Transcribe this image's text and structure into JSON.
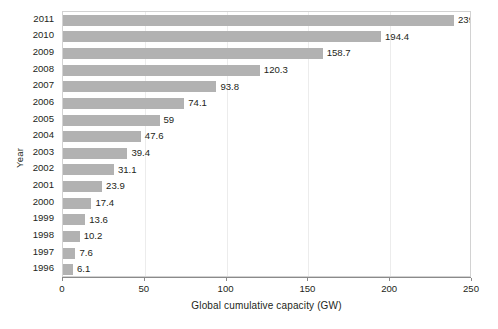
{
  "chart_data": {
    "type": "bar",
    "orientation": "horizontal",
    "title": "",
    "xlabel": "Global cumulative capacity (GW)",
    "ylabel": "Year",
    "categories": [
      "2011",
      "2010",
      "2009",
      "2008",
      "2007",
      "2006",
      "2005",
      "2004",
      "2003",
      "2002",
      "2001",
      "2000",
      "1999",
      "1998",
      "1997",
      "1996"
    ],
    "values": [
      239.0,
      194.4,
      158.7,
      120.3,
      93.8,
      74.1,
      59,
      47.6,
      39.4,
      31.1,
      23.9,
      17.4,
      13.6,
      10.2,
      7.6,
      6.1
    ],
    "value_labels": [
      "239.0",
      "194.4",
      "158.7",
      "120.3",
      "93.8",
      "74.1",
      "59",
      "47.6",
      "39.4",
      "31.1",
      "23.9",
      "17.4",
      "13.6",
      "10.2",
      "7.6",
      "6.1"
    ],
    "xlim": [
      0,
      250
    ],
    "xticks": [
      0,
      50,
      100,
      150,
      200,
      250
    ],
    "xtick_labels": [
      "0",
      "50",
      "100",
      "150",
      "200",
      "250"
    ],
    "grid": true,
    "grid_axis": "x",
    "legend": false,
    "bar_color": "#b2b2b2",
    "frame_color": "#d2d2d2",
    "gridline_color": "#ececec",
    "text_color": "#231f20",
    "background": "#ffffff"
  }
}
